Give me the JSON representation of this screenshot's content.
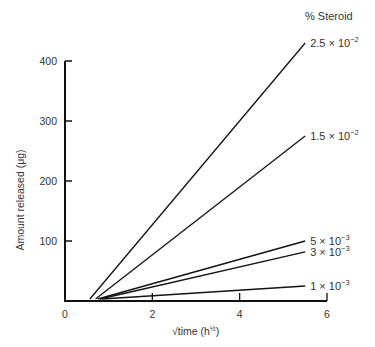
{
  "chart_data": {
    "type": "line",
    "title": "",
    "xlabel": "√time (h½)",
    "ylabel": "Amount released (μg)",
    "legend_title": "% Steroid",
    "xlim": [
      0,
      6
    ],
    "ylim": [
      0,
      400
    ],
    "x_ticks": [
      0,
      2,
      4,
      6
    ],
    "y_ticks": [
      100,
      200,
      300,
      400
    ],
    "grid": false,
    "series": [
      {
        "name": "2.5 × 10⁻²",
        "mantissa": "2.5 × 10",
        "exp": "−2",
        "x": [
          0.57,
          5.5
        ],
        "y": [
          0,
          430
        ]
      },
      {
        "name": "1.5 × 10⁻²",
        "mantissa": "1.5 × 10",
        "exp": "−2",
        "x": [
          0.7,
          5.5
        ],
        "y": [
          0,
          275
        ]
      },
      {
        "name": "5 × 10⁻³",
        "mantissa": "5 × 10",
        "exp": "−3",
        "x": [
          0.75,
          5.5
        ],
        "y": [
          0,
          100
        ]
      },
      {
        "name": "3 × 10⁻³",
        "mantissa": "3 × 10",
        "exp": "−3",
        "x": [
          0.8,
          5.5
        ],
        "y": [
          0,
          82
        ]
      },
      {
        "name": "1 × 10⁻³",
        "mantissa": "1 × 10",
        "exp": "−3",
        "x": [
          0.85,
          5.5
        ],
        "y": [
          0,
          25
        ]
      }
    ]
  }
}
